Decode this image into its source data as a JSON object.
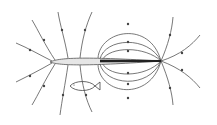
{
  "diagram": {
    "elements": [
      {
        "name": "electric-fish-body",
        "label": ""
      },
      {
        "name": "electric-organ",
        "label": ""
      },
      {
        "name": "small-fish",
        "label": ""
      },
      {
        "name": "field-lines",
        "label": ""
      }
    ],
    "colors": {
      "line": "#555555",
      "body_fill": "#e6e6e6",
      "organ": "#222222",
      "background": "#ffffff"
    }
  }
}
